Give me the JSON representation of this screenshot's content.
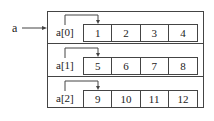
{
  "pointer_label": "a",
  "rows": [
    {
      "label": "a[0]",
      "values": [
        "1",
        "2",
        "3",
        "4"
      ]
    },
    {
      "label": "a[1]",
      "values": [
        "5",
        "6",
        "7",
        "8"
      ]
    },
    {
      "label": "a[2]",
      "values": [
        "9",
        "10",
        "11",
        "12"
      ]
    }
  ]
}
